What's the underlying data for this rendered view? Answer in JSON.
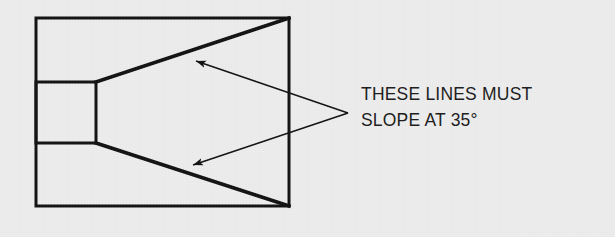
{
  "canvas": {
    "width": 615,
    "height": 237,
    "background_color": "#ededed",
    "ink_color": "#111111"
  },
  "annotation": {
    "line_1": "THESE LINES MUST",
    "line_2_prefix": "SLOPE AT 35",
    "degree_symbol": "°",
    "full_text": "THESE LINES MUST SLOPE AT 35°",
    "angle_value": "35",
    "angle_unit": "degrees"
  },
  "diagram": {
    "outer_rectangle": {
      "x": 36,
      "y": 18,
      "width": 253,
      "height": 188,
      "stroke_width": 3
    },
    "inner_rectangle": {
      "x": 36,
      "y": 82,
      "width": 60,
      "height": 61,
      "stroke_width": 3
    },
    "taper_lines": [
      {
        "name": "upper-taper-line",
        "x1": 96,
        "y1": 82,
        "x2": 289,
        "y2": 18,
        "stroke_width": 3.6
      },
      {
        "name": "lower-taper-line",
        "x1": 96,
        "y1": 143,
        "x2": 289,
        "y2": 206,
        "stroke_width": 3.6
      }
    ],
    "leader_lines": [
      {
        "name": "upper-leader-line",
        "from_x": 348,
        "from_y": 113,
        "to_x": 191,
        "to_y": 59,
        "stroke_width": 1.5,
        "arrowhead": "at-target"
      },
      {
        "name": "lower-leader-line",
        "from_x": 348,
        "from_y": 113,
        "to_x": 188,
        "to_y": 167,
        "stroke_width": 1.5,
        "arrowhead": "at-target"
      }
    ],
    "leader_vertex": {
      "x": 348,
      "y": 113
    }
  }
}
